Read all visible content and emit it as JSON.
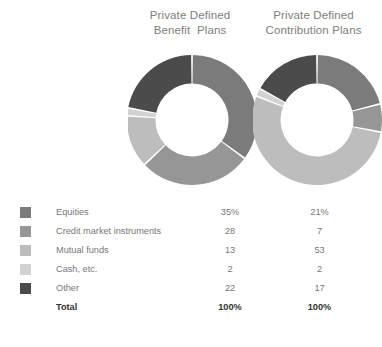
{
  "charts": [
    {
      "id": "private-defined-benefit-plans",
      "title_lines": [
        "Private Defined",
        "Benefit  Plans"
      ],
      "title_full": "Private Defined Benefit Plans"
    },
    {
      "id": "private-defined-contribution-plans",
      "title_lines": [
        "Private Defined",
        "Contribution Plans"
      ],
      "title_full": "Private Defined Contribution Plans"
    }
  ],
  "colors": {
    "equities": "#7b7b7b",
    "credit_market_instruments": "#969696",
    "mutual_funds": "#bdbdbd",
    "cash_etc": "#d2d2d2",
    "other": "#4b4b4b",
    "background": "#ffffff",
    "text": "#787878",
    "title_text": "#7e7e7e",
    "total_text": "#333333",
    "slice_gap": "#ffffff"
  },
  "legend": {
    "rows": [
      {
        "label": "Equities",
        "color_key": "equities",
        "v1": "35%",
        "v2": "21%"
      },
      {
        "label": "Credit market instruments",
        "color_key": "credit_market_instruments",
        "v1": "28",
        "v2": "7"
      },
      {
        "label": "Mutual funds",
        "color_key": "mutual_funds",
        "v1": "13",
        "v2": "53"
      },
      {
        "label": "Cash, etc.",
        "color_key": "cash_etc",
        "v1": "2",
        "v2": "2"
      },
      {
        "label": "Other",
        "color_key": "other",
        "v1": "22",
        "v2": "17"
      }
    ],
    "total": {
      "label": "Total",
      "v1": "100%",
      "v2": "100%"
    }
  },
  "chart_data": [
    {
      "type": "pie",
      "variant": "donut",
      "title": "Private Defined Benefit Plans",
      "categories": [
        "Equities",
        "Credit market instruments",
        "Mutual funds",
        "Cash, etc.",
        "Other"
      ],
      "values": [
        35,
        28,
        13,
        2,
        22
      ],
      "unit": "percent",
      "total": 100,
      "start_angle_deg": 0,
      "direction": "clockwise",
      "inner_radius_ratio": 0.56,
      "legend": "shared-table-below",
      "colors": [
        "#7b7b7b",
        "#969696",
        "#bdbdbd",
        "#d2d2d2",
        "#4b4b4b"
      ]
    },
    {
      "type": "pie",
      "variant": "donut",
      "title": "Private Defined Contribution Plans",
      "categories": [
        "Equities",
        "Credit market instruments",
        "Mutual funds",
        "Cash, etc.",
        "Other"
      ],
      "values": [
        21,
        7,
        53,
        2,
        17
      ],
      "unit": "percent",
      "total": 100,
      "start_angle_deg": 0,
      "direction": "clockwise",
      "inner_radius_ratio": 0.56,
      "legend": "shared-table-below",
      "colors": [
        "#7b7b7b",
        "#969696",
        "#bdbdbd",
        "#d2d2d2",
        "#4b4b4b"
      ]
    }
  ]
}
